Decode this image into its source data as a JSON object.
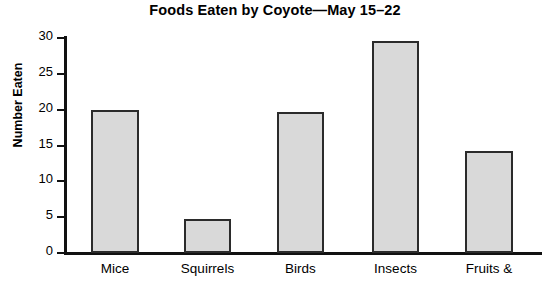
{
  "chart_data": {
    "type": "bar",
    "title": "Foods Eaten by Coyote—May 15–22",
    "xlabel": "",
    "ylabel": "Number Eaten",
    "categories": [
      "Mice",
      "Squirrels",
      "Birds",
      "Insects",
      "Fruits &"
    ],
    "values": [
      20,
      4.7,
      19.7,
      29.6,
      14.3
    ],
    "ylim": [
      0,
      30
    ],
    "yticks": [
      0,
      5,
      10,
      15,
      20,
      25,
      30
    ],
    "ytick_labels": [
      "0",
      "5",
      "10",
      "15",
      "20",
      "25",
      "30"
    ],
    "grid": false,
    "legend": false,
    "bar_fill_color": "#d9d9d9",
    "bar_edge_color": "#2b2b2b",
    "axis_color": "#111111",
    "background_color": "#ffffff",
    "note": "Bottom category label row is clipped by the image edge; 'Fruits &' continues below the visible area."
  }
}
